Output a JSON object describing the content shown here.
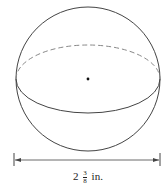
{
  "diagram": {
    "shape": "sphere",
    "dimension": {
      "whole": "2",
      "numerator": "3",
      "denominator": "8",
      "unit": "in."
    },
    "colors": {
      "stroke": "#444444",
      "dash": "#888888"
    }
  }
}
